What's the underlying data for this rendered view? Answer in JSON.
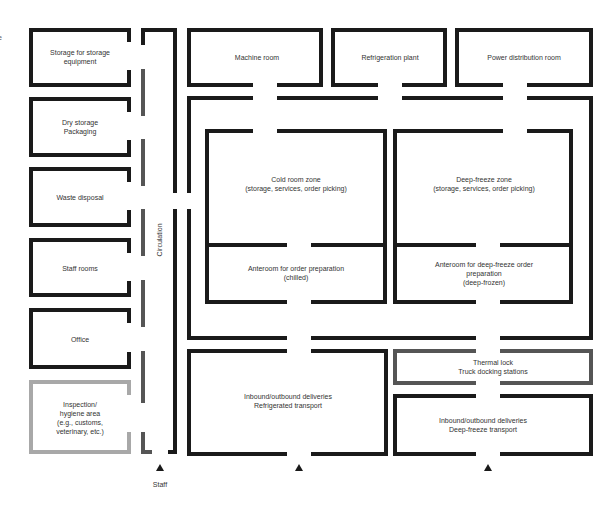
{
  "colors": {
    "wall": "#1a1a1a",
    "wall_gray": "#555555",
    "wall_light": "#a8a8a8",
    "text": "#333333"
  },
  "edge_fragment": "e",
  "left_rooms": [
    {
      "id": "storage-equipment",
      "label": "Storage for storage\nequipment"
    },
    {
      "id": "dry-storage",
      "label": "Dry storage\nPackaging"
    },
    {
      "id": "waste-disposal",
      "label": "Waste disposal"
    },
    {
      "id": "staff-rooms",
      "label": "Staff rooms"
    },
    {
      "id": "office",
      "label": "Office"
    },
    {
      "id": "inspection",
      "label": "Inspection/\nhygiene area\n(e.g., customs,\nveterinary, etc.)"
    }
  ],
  "corridor": {
    "label": "Circulation"
  },
  "top_rooms": [
    {
      "id": "machine-room",
      "label": "Machine room"
    },
    {
      "id": "refrigeration-plant",
      "label": "Refrigeration plant"
    },
    {
      "id": "power-distribution",
      "label": "Power distribution room"
    }
  ],
  "zones": {
    "cold_room": {
      "label": "Cold room zone\n(storage, services, order picking)"
    },
    "cold_anteroom": {
      "label": "Anteroom for order preparation\n(chilled)"
    },
    "deep_freeze": {
      "label": "Deep-freeze zone\n(storage, services, order picking)"
    },
    "deep_anteroom": {
      "label": "Anteroom for deep-freeze order preparation\n(deep-frozen)"
    }
  },
  "bottom_rooms": {
    "refrigerated_delivery": {
      "label": "Inbound/outbound deliveries\nRefrigerated transport"
    },
    "thermal_lock": {
      "label": "Thermal lock\nTruck docking stations"
    },
    "deepfreeze_delivery": {
      "label": "Inbound/outbound deliveries\nDeep-freeze transport"
    }
  },
  "entrances": [
    {
      "id": "staff",
      "label": "Staff"
    },
    {
      "id": "refrigerated",
      "label": ""
    },
    {
      "id": "deep-freeze",
      "label": ""
    }
  ]
}
